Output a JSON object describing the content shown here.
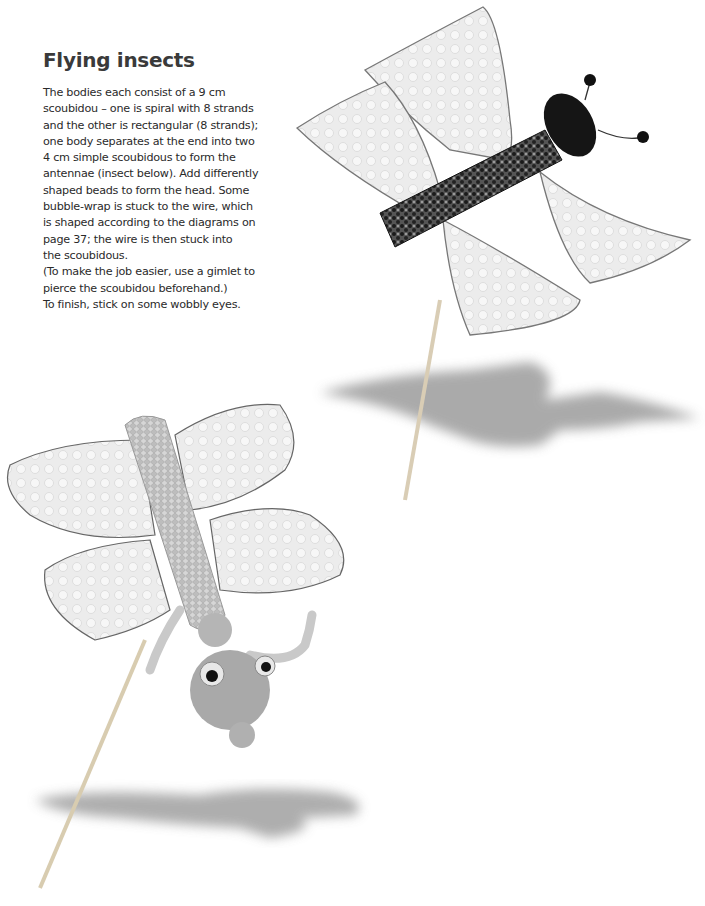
{
  "page": {
    "heading": "Flying insects",
    "body_lines": [
      "The bodies each consist of a 9 cm",
      "scoubidou – one is spiral with 8 strands",
      "and the other is rectangular (8 strands);",
      "one body separates at the end into two",
      "4 cm simple scoubidous to form the",
      "antennae (insect below). Add differently",
      "shaped beads to form the head. Some",
      "bubble-wrap is stuck to the wire, which",
      "is shaped according to the diagrams on",
      "page 37; the wire is then stuck into",
      "the scoubidous.",
      "(To make the job easier, use a gimlet to",
      "pierce the scoubidou beforehand.)",
      "To finish, stick on some wobbly eyes."
    ]
  },
  "photos": [
    {
      "label": "insect-top-dark-spiral-body"
    },
    {
      "label": "insect-bottom-light-rectangular-body"
    }
  ]
}
